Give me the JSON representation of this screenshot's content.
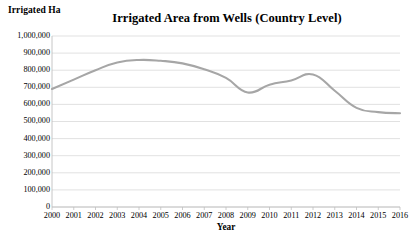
{
  "chart_data": {
    "type": "line",
    "title": "Irrigated Area from Wells (Country Level)",
    "ylabel": "Irrigated Ha",
    "xlabel": "Year",
    "categories": [
      2000,
      2001,
      2002,
      2003,
      2004,
      2005,
      2006,
      2007,
      2008,
      2009,
      2010,
      2011,
      2012,
      2013,
      2014,
      2015,
      2016
    ],
    "values": [
      690000,
      745000,
      800000,
      845000,
      860000,
      855000,
      840000,
      805000,
      755000,
      670000,
      715000,
      740000,
      775000,
      680000,
      580000,
      555000,
      548000
    ],
    "ylim": [
      0,
      1000000
    ],
    "ytick_labels": [
      "1,000,000",
      "900,000",
      "800,000",
      "700,000",
      "600,000",
      "500,000",
      "400,000",
      "300,000",
      "200,000",
      "100,000",
      "0"
    ],
    "ytick_values": [
      1000000,
      900000,
      800000,
      700000,
      600000,
      500000,
      400000,
      300000,
      200000,
      100000,
      0
    ],
    "xtick_labels": [
      "2000",
      "2001",
      "2002",
      "2003",
      "2004",
      "2005",
      "2006",
      "2007",
      "2008",
      "2009",
      "2010",
      "2011",
      "2012",
      "2013",
      "2014",
      "2015",
      "2016"
    ],
    "grid": true,
    "legend": false,
    "series_color": "#a6a6a6",
    "grid_color": "#d9d9d9",
    "axis_color": "#bfbfbf"
  }
}
